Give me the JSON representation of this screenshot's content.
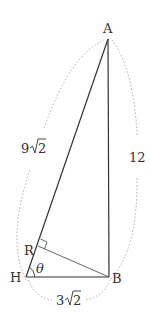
{
  "diagram": {
    "vertices": {
      "A": {
        "label": "A",
        "x": 108,
        "y": 39
      },
      "H": {
        "label": "H",
        "x": 26,
        "y": 277
      },
      "B": {
        "label": "B",
        "x": 109,
        "y": 277
      },
      "R": {
        "label": "R",
        "x": 38,
        "y": 246
      }
    },
    "edges": [
      {
        "from": "A",
        "to": "H",
        "label": "9√2",
        "label_parts": {
          "coef": "9",
          "radicand": "2"
        }
      },
      {
        "from": "A",
        "to": "B",
        "label": "12"
      },
      {
        "from": "H",
        "to": "B",
        "label": "3√2",
        "label_parts": {
          "coef": "3",
          "radicand": "2"
        }
      },
      {
        "from": "B",
        "to": "R",
        "label": ""
      }
    ],
    "angle_label": "θ",
    "right_angle_at": "R",
    "colors": {
      "line": "#333333",
      "dotted": "#aaaaaa",
      "text": "#333333"
    }
  }
}
